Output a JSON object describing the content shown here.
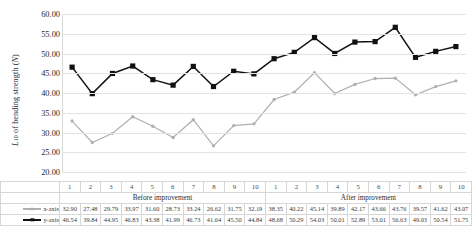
{
  "chart_data": {
    "type": "line",
    "title": "",
    "xlabel": "",
    "ylabel": "L10 of bending strength (N)",
    "ylim": [
      20,
      60
    ],
    "ytick_labels": [
      "60.00",
      "55.00",
      "50.00",
      "45.00",
      "40.00",
      "35.00",
      "30.00",
      "25.00",
      "20.00"
    ],
    "ytick_values": [
      60,
      55,
      50,
      45,
      40,
      35,
      30,
      25,
      20
    ],
    "grid": true,
    "legend_position": "table-left",
    "categories": [
      "1",
      "2",
      "3",
      "4",
      "5",
      "6",
      "7",
      "8",
      "9",
      "10",
      "1",
      "2",
      "3",
      "4",
      "5",
      "6",
      "7",
      "8",
      "9",
      "10"
    ],
    "groups": [
      {
        "label": "Before improvement",
        "span": 10
      },
      {
        "label": "After improvement",
        "span": 10
      }
    ],
    "series": [
      {
        "name": "x-axis",
        "color": "#b0b0b0",
        "marker": "circle",
        "values": [
          32.9,
          27.48,
          29.79,
          33.97,
          31.6,
          28.73,
          33.24,
          26.62,
          31.75,
          32.19,
          38.35,
          40.22,
          45.14,
          39.89,
          42.17,
          43.66,
          43.76,
          39.57,
          41.62,
          43.07
        ]
      },
      {
        "name": "y-axis",
        "color": "#111111",
        "marker": "square",
        "values": [
          46.54,
          39.84,
          44.95,
          46.83,
          43.38,
          41.99,
          46.73,
          41.64,
          45.5,
          44.84,
          48.68,
          50.29,
          54.03,
          50.01,
          52.89,
          53.01,
          56.63,
          49.03,
          50.54,
          51.75
        ]
      }
    ]
  },
  "table": {
    "row_labels": [
      "x-axis",
      "y-axis"
    ]
  }
}
